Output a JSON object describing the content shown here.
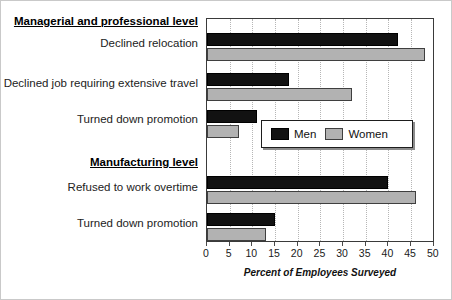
{
  "chart_data": {
    "type": "bar",
    "orientation": "horizontal",
    "title": "",
    "xlabel": "Percent of Employees Surveyed",
    "ylabel": "",
    "xlim": [
      0,
      50
    ],
    "xticks": [
      "0",
      "5",
      "10",
      "15",
      "20",
      "25",
      "30",
      "35",
      "40",
      "45",
      "50"
    ],
    "grid": true,
    "legend_position": "center-right-inside",
    "groups": [
      {
        "name": "Managerial and professional level",
        "categories": [
          "Declined relocation",
          "Declined job requiring extensive travel",
          "Turned down promotion"
        ],
        "series": [
          {
            "name": "Men",
            "color": "#121212",
            "values": [
              42,
              18,
              11
            ]
          },
          {
            "name": "Women",
            "color": "#b2b2b2",
            "values": [
              48,
              32,
              7
            ]
          }
        ]
      },
      {
        "name": "Manufacturing level",
        "categories": [
          "Refused to work overtime",
          "Turned down promotion"
        ],
        "series": [
          {
            "name": "Men",
            "color": "#121212",
            "values": [
              40,
              15
            ]
          },
          {
            "name": "Women",
            "color": "#b2b2b2",
            "values": [
              46,
              13
            ]
          }
        ]
      }
    ],
    "legend": [
      {
        "label": "Men",
        "color": "#121212"
      },
      {
        "label": "Women",
        "color": "#b2b2b2"
      }
    ]
  },
  "labels": {
    "group1_title": "Managerial and professional level",
    "g1_cat1": "Declined relocation",
    "g1_cat2": "Declined job requiring extensive travel",
    "g1_cat3": "Turned down promotion",
    "group2_title": "Manufacturing level",
    "g2_cat1": "Refused to work overtime",
    "g2_cat2": "Turned down promotion"
  },
  "axis": {
    "title": "Percent of Employees Surveyed",
    "t0": "0",
    "t1": "5",
    "t2": "10",
    "t3": "15",
    "t4": "20",
    "t5": "25",
    "t6": "30",
    "t7": "35",
    "t8": "40",
    "t9": "45",
    "t10": "50"
  },
  "legend": {
    "men": "Men",
    "women": "Women"
  }
}
